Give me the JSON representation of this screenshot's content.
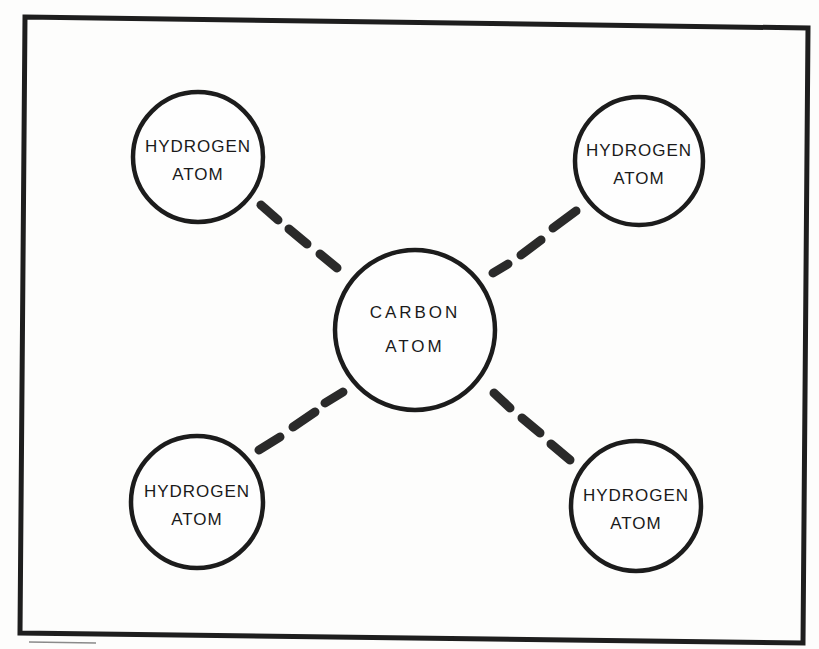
{
  "diagram": {
    "colors": {
      "ink": "#1c1c1c",
      "paper": "#fdfdfc"
    },
    "frame": {
      "points": [
        [
          25,
          17
        ],
        [
          808,
          28
        ],
        [
          803,
          643
        ],
        [
          20,
          633
        ]
      ]
    },
    "center_atom": {
      "id": "carbon",
      "line1": "CARBON",
      "line2": "ATOM",
      "cx": 415,
      "cy": 330,
      "r": 80
    },
    "atoms": [
      {
        "id": "hydrogen-top-left",
        "line1": "HYDROGEN",
        "line2": "ATOM",
        "cx": 198,
        "cy": 157,
        "r": 65
      },
      {
        "id": "hydrogen-top-right",
        "line1": "HYDROGEN",
        "line2": "ATOM",
        "cx": 639,
        "cy": 161,
        "r": 64
      },
      {
        "id": "hydrogen-bottom-left",
        "line1": "HYDROGEN",
        "line2": "ATOM",
        "cx": 197,
        "cy": 502,
        "r": 66
      },
      {
        "id": "hydrogen-bottom-right",
        "line1": "HYDROGEN",
        "line2": "ATOM",
        "cx": 636,
        "cy": 506,
        "r": 65
      }
    ],
    "bonds": [
      {
        "id": "bond-top-left",
        "style": "dashed",
        "dashes": [
          [
            [
              261,
              205
            ],
            [
              278,
              220
            ]
          ],
          [
            [
              289,
              229
            ],
            [
              307,
              244
            ]
          ],
          [
            [
              320,
              254
            ],
            [
              337,
              268
            ]
          ]
        ]
      },
      {
        "id": "bond-top-right",
        "style": "dashed",
        "dashes": [
          [
            [
              493,
              273
            ],
            [
              508,
              264
            ]
          ],
          [
            [
              521,
              255
            ],
            [
              541,
              240
            ]
          ],
          [
            [
              553,
              228
            ],
            [
              576,
              211
            ]
          ]
        ]
      },
      {
        "id": "bond-bottom-left",
        "style": "dashed",
        "dashes": [
          [
            [
              259,
              450
            ],
            [
              280,
              437
            ]
          ],
          [
            [
              293,
              427
            ],
            [
              315,
              412
            ]
          ],
          [
            [
              325,
              403
            ],
            [
              343,
              392
            ]
          ]
        ]
      },
      {
        "id": "bond-bottom-right",
        "style": "dashed",
        "dashes": [
          [
            [
              494,
              393
            ],
            [
              510,
              408
            ]
          ],
          [
            [
              522,
              418
            ],
            [
              540,
              433
            ]
          ],
          [
            [
              551,
              444
            ],
            [
              570,
              460
            ]
          ]
        ]
      }
    ],
    "marks": {
      "underline": [
        [
          29,
          642
        ],
        [
          96,
          643
        ]
      ]
    }
  }
}
